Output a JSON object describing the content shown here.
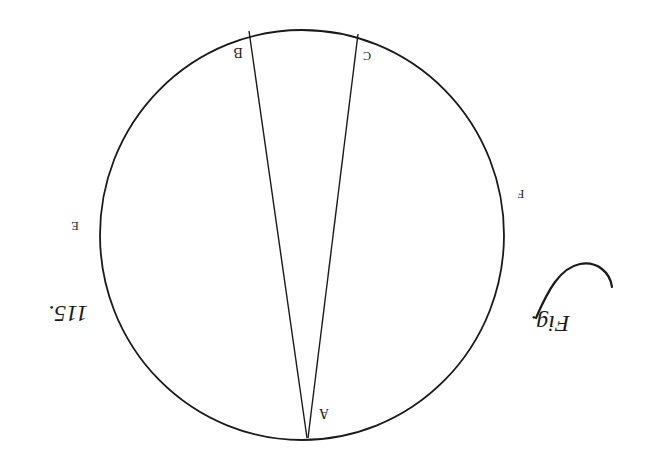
{
  "figure": {
    "caption_word": "Fig.",
    "caption_number": "115.",
    "orientation": "rotated 180°",
    "points": {
      "A": "A",
      "B": "B",
      "C": "C",
      "E": "E",
      "F": "F"
    },
    "colors": {
      "ink": "#1a1a1a",
      "paper": "#ffffff"
    }
  }
}
